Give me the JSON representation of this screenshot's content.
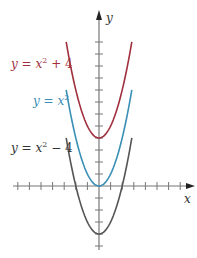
{
  "chart_data": {
    "type": "line",
    "title": "",
    "xlabel": "x",
    "ylabel": "y",
    "xlim": [
      -7.5,
      8
    ],
    "ylim": [
      -5,
      12.5
    ],
    "grid": false,
    "legend_position": "inline-left",
    "x_ticks_units": [
      -7,
      -6,
      -5,
      -4,
      -3,
      -2,
      -1,
      1,
      2,
      3,
      4,
      5,
      6,
      7
    ],
    "y_ticks_units": [
      -5,
      -4,
      -3,
      -2,
      -1,
      1,
      2,
      3,
      4,
      5,
      6,
      7,
      8,
      9,
      10,
      11,
      12
    ],
    "series": [
      {
        "name": "y = x² + 4",
        "equation": "x^2 + 4",
        "color": "#a0303e",
        "x_range": [
          -2.83,
          2.83
        ],
        "vertex": [
          0,
          4
        ]
      },
      {
        "name": "y = x²",
        "equation": "x^2",
        "color": "#3a8fb5",
        "x_range": [
          -2.83,
          2.83
        ],
        "vertex": [
          0,
          0
        ]
      },
      {
        "name": "y = x² − 4",
        "equation": "x^2 - 4",
        "color": "#555555",
        "x_range": [
          -2.83,
          2.83
        ],
        "vertex": [
          0,
          -4
        ]
      }
    ]
  },
  "labels": {
    "x_axis": "x",
    "y_axis": "y",
    "curve1": {
      "prefix": "y = x",
      "sup": "2",
      "suffix": " + 4"
    },
    "curve2": {
      "prefix": "y = x",
      "sup": "2",
      "suffix": ""
    },
    "curve3": {
      "prefix": "y = x",
      "sup": "2",
      "suffix": " − 4"
    }
  },
  "colors": {
    "axis": "#777777",
    "red": "#a0303e",
    "blue": "#3a8fb5",
    "black": "#555555"
  }
}
